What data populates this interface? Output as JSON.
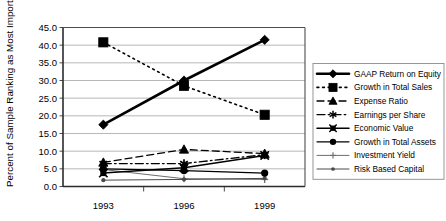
{
  "chart_data": {
    "type": "line",
    "title": "",
    "xlabel": "",
    "ylabel": "Percent of Sample Ranking as Most Important",
    "categories": [
      "1993",
      "1996",
      "1999"
    ],
    "x_tick_labels": [
      "1993",
      "1996",
      "1999"
    ],
    "y_tick_labels": [
      "0.0",
      "5.0",
      "10.0",
      "15.0",
      "20.0",
      "25.0",
      "30.0",
      "35.0",
      "40.0",
      "45.0"
    ],
    "y_ticks": [
      0,
      5,
      10,
      15,
      20,
      25,
      30,
      35,
      40,
      45
    ],
    "ylim": [
      0,
      45
    ],
    "grid": "horizontal",
    "legend_position": "right",
    "series": [
      {
        "name": "GAAP Return on Equity",
        "values": [
          17.5,
          30.0,
          41.5
        ],
        "marker": "diamond",
        "line_style": "solid",
        "line_width": 2.6,
        "color": "#000000"
      },
      {
        "name": "Growth in Total Sales",
        "values": [
          40.8,
          28.5,
          20.3
        ],
        "marker": "square",
        "line_style": "dotted",
        "line_width": 1.6,
        "color": "#000000"
      },
      {
        "name": "Expense Ratio",
        "values": [
          6.8,
          10.5,
          9.3
        ],
        "marker": "triangle",
        "line_style": "dashed",
        "line_width": 1.3,
        "color": "#000000"
      },
      {
        "name": "Earnings per Share",
        "values": [
          6.5,
          6.5,
          9.0
        ],
        "marker": "asterisk",
        "line_style": "dashdot",
        "line_width": 1.3,
        "color": "#000000"
      },
      {
        "name": "Economic Value",
        "values": [
          3.8,
          5.3,
          8.8
        ],
        "marker": "x-square",
        "line_style": "solid",
        "line_width": 1.5,
        "color": "#000000"
      },
      {
        "name": "Growth in Total Assets",
        "values": [
          5.0,
          4.5,
          3.8
        ],
        "marker": "circle",
        "line_style": "solid",
        "line_width": 1.2,
        "color": "#000000"
      },
      {
        "name": "Investment Yield",
        "values": [
          4.8,
          2.2,
          2.0
        ],
        "marker": "plus",
        "line_style": "solid",
        "line_width": 1.0,
        "color": "#6e6e6e"
      },
      {
        "name": "Risk Based Capital",
        "values": [
          1.8,
          2.0,
          2.3
        ],
        "marker": "dot",
        "line_style": "solid",
        "line_width": 1.0,
        "color": "#4a4a4a"
      }
    ]
  }
}
